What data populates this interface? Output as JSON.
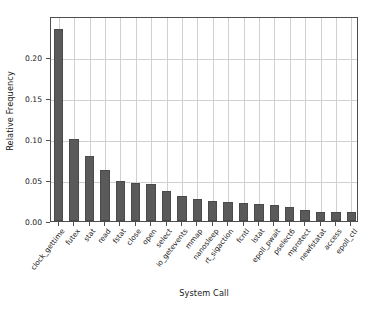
{
  "chart_data": {
    "type": "bar",
    "title": "",
    "xlabel": "System Call",
    "ylabel": "Relative Frequency",
    "grid": true,
    "legend": null,
    "ylim": [
      0.0,
      0.25
    ],
    "yticks": [
      "0.00",
      "0.05",
      "0.10",
      "0.15",
      "0.20"
    ],
    "ytick_values": [
      0.0,
      0.05,
      0.1,
      0.15,
      0.2
    ],
    "categories": [
      "clock_gettime",
      "futex",
      "stat",
      "read",
      "fstat",
      "close",
      "open",
      "select",
      "io_getevents",
      "mmap",
      "nanosleep",
      "rt_sigaction",
      "fcntl",
      "lstat",
      "epoll_pwait",
      "pselect6",
      "mprotect",
      "newfstatat",
      "access",
      "epoll_ctl"
    ],
    "values": [
      0.234,
      0.1,
      0.079,
      0.062,
      0.049,
      0.046,
      0.045,
      0.037,
      0.031,
      0.027,
      0.024,
      0.0235,
      0.0225,
      0.021,
      0.019,
      0.017,
      0.014,
      0.011,
      0.011,
      0.0105
    ],
    "bar_color": "#5a5a5a",
    "grid_color": "#d0d0d0",
    "axis_color": "#4d4d4d",
    "background": "#ffffff"
  }
}
